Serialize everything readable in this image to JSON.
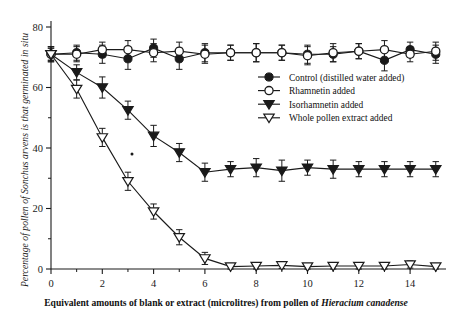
{
  "figure": {
    "background_color": "#ffffff",
    "ink_color": "#1a1a1a"
  },
  "chart_data": {
    "type": "line",
    "title": "",
    "subtitle": "",
    "xlabel_parts": {
      "lead": "Equivalent amounts of blank or extract (microlitres) from pollen of ",
      "species": "Hieracium canadense"
    },
    "xlabel": "Equivalent amounts of blank or extract (microlitres) from pollen of Hieracium canadense",
    "ylabel": "Percentage of pollen of Sonchus arvens is that germinated in situ",
    "xlim": [
      0,
      15.4
    ],
    "ylim": [
      0,
      80
    ],
    "xticks": [
      0,
      2,
      4,
      6,
      8,
      10,
      12,
      14
    ],
    "xtick_labels": [
      "0",
      "2",
      "4",
      "6",
      "8",
      "10",
      "12",
      "14"
    ],
    "yticks": [
      0,
      20,
      40,
      60,
      80
    ],
    "ytick_labels": [
      "0",
      "20",
      "40",
      "60",
      "80"
    ],
    "x_minor_ticks": [
      1,
      3,
      5,
      7,
      9,
      11,
      13,
      15
    ],
    "grid": false,
    "legend_position": "upper right inside",
    "error_bars": true,
    "x": [
      0,
      1,
      2,
      3,
      4,
      5,
      6,
      7,
      8,
      9,
      10,
      11,
      12,
      13,
      14,
      15
    ],
    "series": [
      {
        "name": "Control (distilled water added)",
        "marker": "filled-circle",
        "values": [
          71,
          71.5,
          71,
          69.5,
          73,
          69.5,
          71.5,
          71.5,
          71.5,
          71.5,
          71,
          71,
          72,
          69,
          72.5,
          71
        ],
        "errors": [
          2.5,
          2.5,
          3,
          3.5,
          3,
          3.5,
          3,
          2.5,
          3,
          2.5,
          3,
          2.5,
          2.5,
          3.5,
          2.5,
          3
        ]
      },
      {
        "name": "Rhamnetin added",
        "marker": "open-circle",
        "values": [
          71,
          71,
          72.5,
          72.5,
          71.5,
          72,
          71,
          71.5,
          71.5,
          71.5,
          70.5,
          71.5,
          72,
          72.5,
          71,
          72
        ],
        "errors": [
          2.5,
          2.5,
          2.5,
          3,
          3,
          3,
          3,
          2.5,
          3,
          2.5,
          3,
          3,
          2.5,
          3,
          2.5,
          3
        ]
      },
      {
        "name": "Isorhamnetin added",
        "marker": "filled-triangle-down",
        "values": [
          71,
          65,
          60,
          52.5,
          44,
          38.5,
          32,
          33,
          33.5,
          32.5,
          33.5,
          33,
          33,
          33,
          33,
          33
        ],
        "errors": [
          2,
          2.5,
          3.5,
          3,
          3.5,
          3,
          3,
          2.5,
          3,
          3.5,
          2.5,
          3,
          2.5,
          2.5,
          2.5,
          2.5
        ]
      },
      {
        "name": "Whole pollen extract added",
        "marker": "open-triangle-down",
        "values": [
          71,
          59.5,
          43.5,
          29,
          19,
          10.5,
          3.5,
          0.8,
          1,
          1.2,
          0.8,
          1,
          1,
          1,
          1.5,
          0.8
        ],
        "errors": [
          2,
          3,
          3,
          3,
          2.5,
          2.5,
          2,
          1,
          1,
          1,
          1,
          1,
          1,
          1,
          1.2,
          1
        ]
      }
    ]
  },
  "legend": {
    "entries": [
      {
        "label": "Control (distilled water added)",
        "marker": "filled-circle"
      },
      {
        "label": "Rhamnetin added",
        "marker": "open-circle"
      },
      {
        "label": "Isorhamnetin added",
        "marker": "filled-triangle-down"
      },
      {
        "label": "Whole pollen extract added",
        "marker": "open-triangle-down"
      }
    ]
  }
}
